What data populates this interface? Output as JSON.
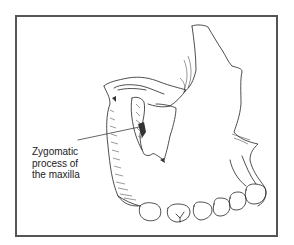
{
  "figure": {
    "label": {
      "lines": [
        "Zygomatic",
        "process of",
        "the maxilla"
      ]
    },
    "colors": {
      "frame": "#555555",
      "line": "#222222",
      "background": "#ffffff"
    }
  }
}
